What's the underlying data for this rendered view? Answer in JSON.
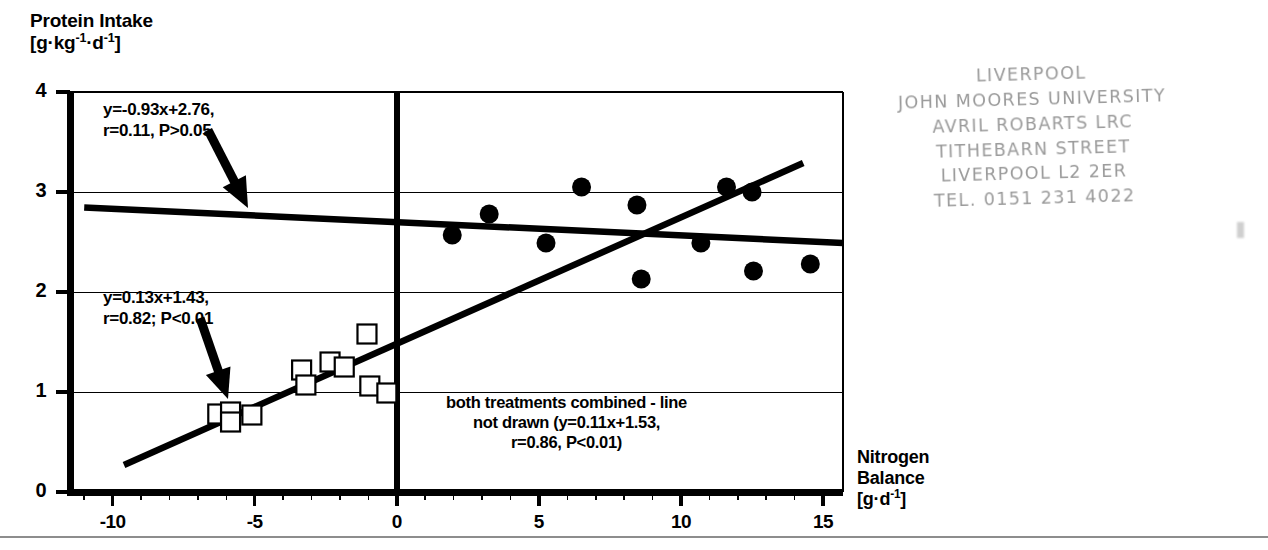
{
  "figure": {
    "y_axis": {
      "title_line1": "Protein Intake",
      "title_line2_pre": "[g·kg",
      "title_line2_sup1": "-1",
      "title_line2_mid": "·d",
      "title_line2_sup2": "-1",
      "title_line2_post": "]",
      "ticks": [
        "0",
        "1",
        "2",
        "3",
        "4"
      ]
    },
    "x_axis": {
      "title_line1": "Nitrogen",
      "title_line2": "Balance",
      "title_line3_pre": "[g·d",
      "title_line3_sup": "-1",
      "title_line3_post": "]",
      "ticks": [
        "-10",
        "-5",
        "0",
        "5",
        "10",
        "15"
      ]
    },
    "annotations": {
      "upper_line1": "y=-0.93x+2.76,",
      "upper_line2": "r=0.11, P>0.05",
      "lower_line1": "y=0.13x+1.43,",
      "lower_line2": "r=0.82; P<0.01",
      "combined_line1": "both treatments combined - line",
      "combined_line2": "not drawn (y=0.11x+1.53,",
      "combined_line3": "r=0.86, P<0.01)"
    },
    "stamp": {
      "line1": "LIVERPOOL",
      "line2": "JOHN MOORES UNIVERSITY",
      "line3": "AVRIL ROBARTS LRC",
      "line4": "TITHEBARN STREET",
      "line5": "LIVERPOOL L2 2ER",
      "line6": "TEL. 0151 231 4022"
    }
  },
  "chart_data": {
    "type": "scatter",
    "title": "",
    "xlabel": "Nitrogen Balance [g·d-1]",
    "ylabel": "Protein Intake [g·kg-1·d-1]",
    "xlim": [
      -11.5,
      15.7
    ],
    "ylim": [
      0,
      4
    ],
    "xticks": [
      -10,
      -5,
      0,
      5,
      10,
      15
    ],
    "yticks": [
      0,
      1,
      2,
      3,
      4
    ],
    "xminor_step": 1,
    "grid": "horizontal gridlines at y=1,2,3; vertical reference line at x=0",
    "legend": "none",
    "series": [
      {
        "name": "open squares (low nitrogen balance treatment)",
        "marker": "open-square",
        "points": [
          [
            -6.3,
            0.78
          ],
          [
            -5.85,
            0.8
          ],
          [
            -5.85,
            0.7
          ],
          [
            -5.1,
            0.77
          ],
          [
            -3.35,
            1.22
          ],
          [
            -3.2,
            1.07
          ],
          [
            -2.35,
            1.3
          ],
          [
            -1.85,
            1.25
          ],
          [
            -1.05,
            1.58
          ],
          [
            -0.95,
            1.06
          ],
          [
            -0.35,
            0.99
          ]
        ]
      },
      {
        "name": "filled circles (high nitrogen balance treatment)",
        "marker": "filled-circle",
        "points": [
          [
            1.95,
            2.57
          ],
          [
            3.25,
            2.78
          ],
          [
            5.25,
            2.49
          ],
          [
            6.5,
            3.05
          ],
          [
            8.45,
            2.87
          ],
          [
            8.6,
            2.13
          ],
          [
            10.7,
            2.49
          ],
          [
            11.6,
            3.05
          ],
          [
            12.5,
            3.0
          ],
          [
            12.55,
            2.21
          ],
          [
            14.55,
            2.28
          ]
        ]
      }
    ],
    "fits": [
      {
        "name": "filled-circle regression",
        "equation": "y=-0.93x+2.76",
        "r": 0.11,
        "p": "P>0.05",
        "drawn": true,
        "drawn_from": [
          -11.0,
          2.845
        ],
        "drawn_to": [
          15.7,
          2.49
        ]
      },
      {
        "name": "open-square regression",
        "equation": "y=0.13x+1.43",
        "r": 0.82,
        "p": "P<0.01",
        "drawn": true,
        "drawn_from": [
          -9.6,
          0.27
        ],
        "drawn_to": [
          14.3,
          3.29
        ]
      },
      {
        "name": "both treatments combined",
        "equation": "y=0.11x+1.53",
        "r": 0.86,
        "p": "P<0.01",
        "drawn": false
      }
    ]
  }
}
